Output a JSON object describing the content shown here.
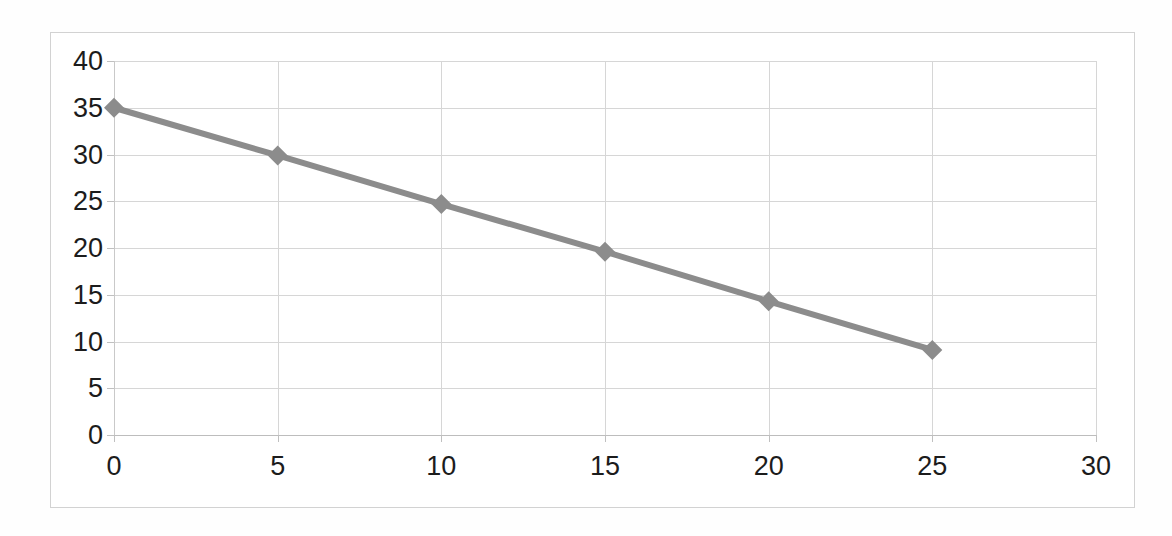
{
  "chart_data": {
    "type": "line",
    "title": "",
    "subtitle": "",
    "xlabel": "",
    "ylabel": "",
    "x": [
      0,
      5,
      10,
      15,
      20,
      25
    ],
    "series": [
      {
        "name": "",
        "values": [
          35.0,
          29.9,
          24.7,
          19.6,
          14.3,
          9.1
        ]
      }
    ],
    "xlim": [
      0,
      30
    ],
    "ylim": [
      0,
      40
    ],
    "xticks": [
      0,
      5,
      10,
      15,
      20,
      25,
      30
    ],
    "yticks": [
      0,
      5,
      10,
      15,
      20,
      25,
      30,
      35,
      40
    ],
    "xtick_labels": [
      "0",
      "5",
      "10",
      "15",
      "20",
      "25",
      "30"
    ],
    "ytick_labels": [
      "0",
      "5",
      "10",
      "15",
      "20",
      "25",
      "30",
      "35",
      "40"
    ],
    "grid": true,
    "grid_axes": "both",
    "legend": false,
    "legend_position": "none",
    "marker": "diamond",
    "line_color": "#8c8c8c",
    "marker_color": "#8c8c8c",
    "grid_color": "#d6d6d6",
    "axis_color": "#bdbdbd",
    "text_color": "#1c1c1c",
    "background_color": "#ffffff",
    "border_color": "#d2d2d2",
    "annotations": []
  }
}
